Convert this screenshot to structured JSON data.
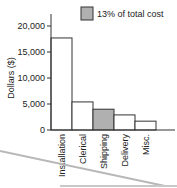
{
  "chart_data": {
    "type": "bar",
    "title": "",
    "xlabel": "",
    "ylabel": "Dollars ($)",
    "categories": [
      "Installation",
      "Clerical",
      "Shipping",
      "Delivery",
      "Misc."
    ],
    "values": [
      17700,
      5400,
      4000,
      2900,
      1700
    ],
    "highlight_index": 2,
    "ylim": [
      0,
      20000
    ],
    "yticks": [
      0,
      5000,
      10000,
      15000,
      20000
    ],
    "ytick_labels": [
      "0",
      "5,000",
      "10,000",
      "15,000",
      "20,000"
    ],
    "grid": false,
    "legend": {
      "position": "top-right",
      "entries": [
        {
          "label": "13% of total cost",
          "color": "#b0b0b0"
        }
      ]
    },
    "colors": {
      "bar_fill": "#ffffff",
      "highlight_fill": "#b0b0b0",
      "stroke": "#333333"
    }
  }
}
